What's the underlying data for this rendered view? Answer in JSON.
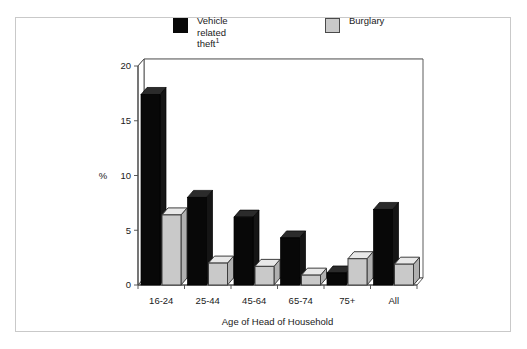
{
  "chart_data": {
    "type": "bar",
    "title": "",
    "xlabel": "Age of Head of Household",
    "ylabel": "%",
    "categories": [
      "16-24",
      "25-44",
      "45-64",
      "65-74",
      "75+",
      "All"
    ],
    "series": [
      {
        "name": "Vehicle\nrelated theft",
        "footnote": "1",
        "color": "#080808",
        "values": [
          17.4,
          8.0,
          6.2,
          4.3,
          1.1,
          6.9
        ]
      },
      {
        "name": "Burglary",
        "footnote": "",
        "color": "#c9c9c9",
        "values": [
          6.4,
          2.0,
          1.7,
          0.9,
          2.4,
          1.9
        ]
      }
    ],
    "ylim": [
      0,
      20
    ],
    "yticks": [
      0,
      5,
      10,
      15,
      20
    ],
    "ytick_labels": [
      "0",
      "5",
      "10",
      "15",
      "20"
    ],
    "grid": true,
    "legend_position": "top",
    "style": "3d-bars"
  },
  "legend": {
    "vehicle_line1": "Vehicle",
    "vehicle_line2": "related theft",
    "vehicle_footnote": "1",
    "burglary_label": "Burglary"
  },
  "axes": {
    "y_label": "%",
    "x_label": "Age of Head of Household",
    "y_tick_0": "0",
    "y_tick_5": "5",
    "y_tick_10": "10",
    "y_tick_15": "15",
    "y_tick_20": "20",
    "x_tick_0": "16-24",
    "x_tick_1": "25-44",
    "x_tick_2": "45-64",
    "x_tick_3": "65-74",
    "x_tick_4": "75+",
    "x_tick_5": "All"
  },
  "colors": {
    "series_dark": "#080808",
    "series_light": "#c9c9c9",
    "grid": "#a8a8a8",
    "axis": "#4a4a4a",
    "frame": "#c9c9c9",
    "text": "#1a1a1a"
  }
}
